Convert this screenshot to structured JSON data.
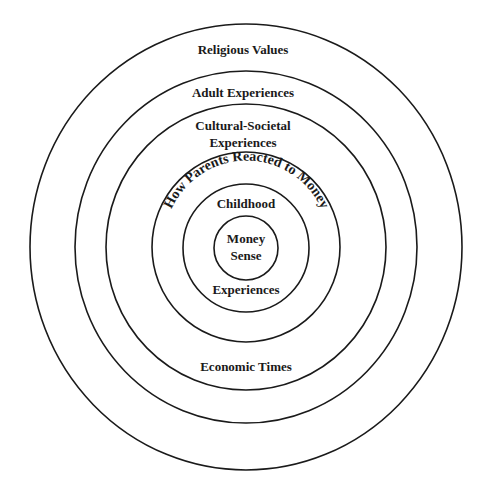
{
  "diagram": {
    "type": "concentric-circles",
    "center": {
      "x": 246,
      "y": 247
    },
    "stroke_color": "#1a1a1a",
    "rings": [
      {
        "id": "religious-values",
        "label": "Religious Values",
        "rx": 216,
        "ry": 223
      },
      {
        "id": "adult-experiences",
        "label": "Adult Experiences",
        "rx": 171,
        "ry": 176
      },
      {
        "id": "cultural-societal",
        "label_line1": "Cultural-Societal",
        "label_line2": "Experiences",
        "label_bottom": "Economic Times",
        "rx": 140,
        "ry": 143
      },
      {
        "id": "how-parents-reacted",
        "label": "How Parents Reacted to Money",
        "rx": 94,
        "ry": 95
      },
      {
        "id": "childhood-experiences",
        "label_top": "Childhood",
        "label_bottom": "Experiences",
        "rx": 63,
        "ry": 64
      },
      {
        "id": "money-sense",
        "label_line1": "Money",
        "label_line2": "Sense",
        "rx": 32,
        "ry": 32
      }
    ]
  }
}
